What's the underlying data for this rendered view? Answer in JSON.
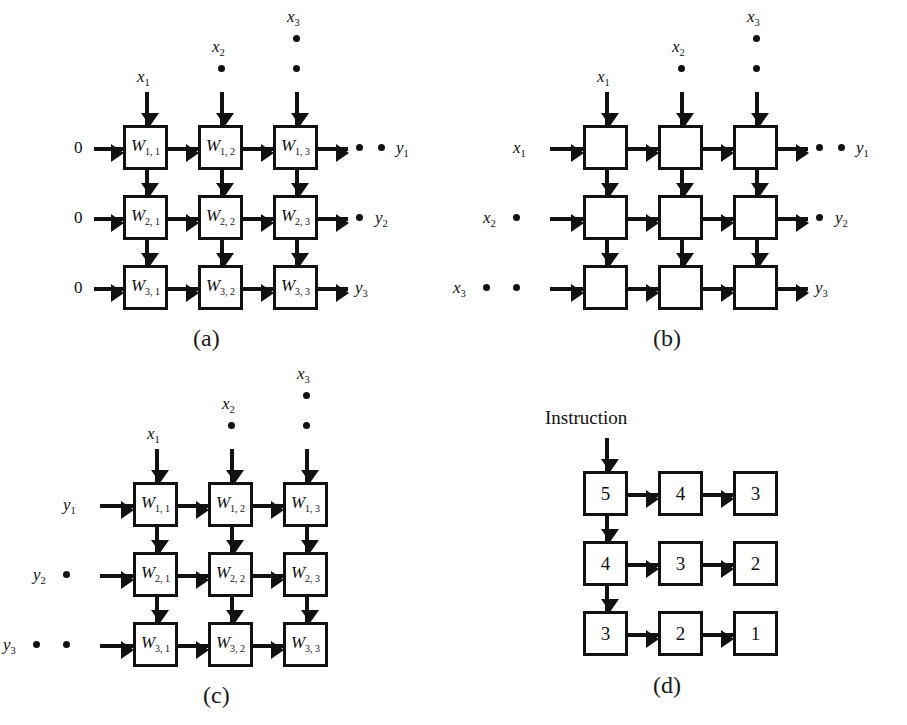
{
  "figure": {
    "type": "diagram",
    "background_color": "#ffffff",
    "line_color": "#111111",
    "panels": [
      {
        "id": "a",
        "caption": "(a)",
        "cells_labeled": true,
        "cells": [
          [
            "W",
            "W",
            "W"
          ],
          [
            "W",
            "W",
            "W"
          ],
          [
            "W",
            "W",
            "W"
          ]
        ],
        "cell_labels": [
          [
            "W1, 1",
            "W1, 2",
            "W1, 3"
          ],
          [
            "W2, 1",
            "W2, 2",
            "W2, 3"
          ],
          [
            "W3, 1",
            "W3, 2",
            "W3, 3"
          ]
        ],
        "cell_base": "W",
        "cell_subs": [
          [
            "1, 1",
            "1, 2",
            "1, 3"
          ],
          [
            "2, 1",
            "2, 2",
            "2, 3"
          ],
          [
            "3, 1",
            "3, 2",
            "3, 3"
          ]
        ],
        "top_inputs": [
          {
            "base": "x",
            "sub": "1",
            "dots": 0
          },
          {
            "base": "x",
            "sub": "2",
            "dots": 1
          },
          {
            "base": "x",
            "sub": "3",
            "dots": 2
          }
        ],
        "left_inputs": [
          {
            "text": "0",
            "dots": 0
          },
          {
            "text": "0",
            "dots": 0
          },
          {
            "text": "0",
            "dots": 0
          }
        ],
        "right_outputs": [
          {
            "base": "y",
            "sub": "1",
            "dots": 2
          },
          {
            "base": "y",
            "sub": "2",
            "dots": 1
          },
          {
            "base": "y",
            "sub": "3",
            "dots": 0
          }
        ],
        "has_right_arrows": true
      },
      {
        "id": "b",
        "caption": "(b)",
        "cells_labeled": false,
        "cell_labels": [
          [
            "",
            "",
            ""
          ],
          [
            "",
            "",
            ""
          ],
          [
            "",
            "",
            ""
          ]
        ],
        "top_inputs": [
          {
            "base": "x",
            "sub": "1",
            "dots": 0
          },
          {
            "base": "x",
            "sub": "2",
            "dots": 1
          },
          {
            "base": "x",
            "sub": "3",
            "dots": 2
          }
        ],
        "left_inputs": [
          {
            "base": "x",
            "sub": "1",
            "dots": 0
          },
          {
            "base": "x",
            "sub": "2",
            "dots": 1
          },
          {
            "base": "x",
            "sub": "3",
            "dots": 2
          }
        ],
        "right_outputs": [
          {
            "base": "y",
            "sub": "1",
            "dots": 2
          },
          {
            "base": "y",
            "sub": "2",
            "dots": 1
          },
          {
            "base": "y",
            "sub": "3",
            "dots": 0
          }
        ],
        "has_right_arrows": true
      },
      {
        "id": "c",
        "caption": "(c)",
        "cells_labeled": true,
        "cell_base": "W",
        "cell_subs": [
          [
            "1, 1",
            "1, 2",
            "1, 3"
          ],
          [
            "2, 1",
            "2, 2",
            "2, 3"
          ],
          [
            "3, 1",
            "3, 2",
            "3, 3"
          ]
        ],
        "top_inputs": [
          {
            "base": "x",
            "sub": "1",
            "dots": 0
          },
          {
            "base": "x",
            "sub": "2",
            "dots": 1
          },
          {
            "base": "x",
            "sub": "3",
            "dots": 2
          }
        ],
        "left_inputs": [
          {
            "base": "y",
            "sub": "1",
            "dots": 0
          },
          {
            "base": "y",
            "sub": "2",
            "dots": 1
          },
          {
            "base": "y",
            "sub": "3",
            "dots": 2
          }
        ],
        "right_outputs": [],
        "has_right_arrows": false
      },
      {
        "id": "d",
        "caption": "(d)",
        "cells_labeled": true,
        "title": "Instruction",
        "values": [
          [
            "5",
            "4",
            "3"
          ],
          [
            "4",
            "3",
            "2"
          ],
          [
            "3",
            "2",
            "1"
          ]
        ],
        "top_inputs": [
          {
            "text": "Instruction",
            "dots": 0
          }
        ],
        "left_inputs": [],
        "right_outputs": [],
        "has_right_arrows": false,
        "vertical_arrows_column": 1
      }
    ],
    "labels": {
      "zero": "0",
      "instruction": "Instruction",
      "caption_a": "(a)",
      "caption_b": "(b)",
      "caption_c": "(c)",
      "caption_d": "(d)",
      "x": "x",
      "y": "y",
      "W": "W",
      "sub_1": "1",
      "sub_2": "2",
      "sub_3": "3",
      "sub_11": "1, 1",
      "sub_12": "1, 2",
      "sub_13": "1, 3",
      "sub_21": "2, 1",
      "sub_22": "2, 2",
      "sub_23": "2, 3",
      "sub_31": "3, 1",
      "sub_32": "3, 2",
      "sub_33": "3, 3",
      "d_5": "5",
      "d_4": "4",
      "d_3": "3",
      "d_2": "2",
      "d_1": "1"
    }
  }
}
